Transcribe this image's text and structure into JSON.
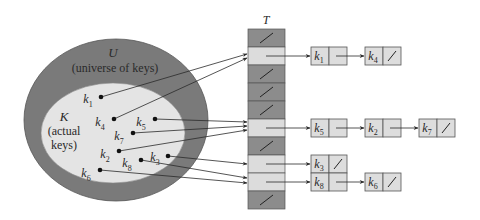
{
  "diagram": {
    "type": "hash-table-chaining",
    "colors": {
      "outer_ellipse": "#7a7a7a",
      "inner_ellipse": "#e4e4e4",
      "slot_empty": "#8c8c8c",
      "slot_used": "#dcdcdc",
      "node_fill": "#dddddd",
      "stroke": "#444444",
      "line": "#2a2a2a"
    },
    "universe": {
      "symbol": "U",
      "caption": "(universe of keys)"
    },
    "actual": {
      "symbol": "K",
      "caption_line1": "(actual",
      "caption_line2": "keys)"
    },
    "table": {
      "label": "T",
      "slots": [
        {
          "index": 0,
          "empty": true
        },
        {
          "index": 1,
          "empty": false,
          "chain": [
            "k1",
            "k4"
          ]
        },
        {
          "index": 2,
          "empty": true
        },
        {
          "index": 3,
          "empty": true
        },
        {
          "index": 4,
          "empty": true
        },
        {
          "index": 5,
          "empty": false,
          "chain": [
            "k5",
            "k2",
            "k7"
          ]
        },
        {
          "index": 6,
          "empty": true
        },
        {
          "index": 7,
          "empty": false,
          "chain": [
            "k3"
          ]
        },
        {
          "index": 8,
          "empty": false,
          "chain": [
            "k8",
            "k6"
          ]
        },
        {
          "index": 9,
          "empty": true
        }
      ]
    },
    "keys": [
      {
        "name": "k",
        "sub": "1",
        "x": 101,
        "y": 97,
        "lx": 88,
        "ly": 103,
        "slot": 1,
        "ax": 247,
        "ay": 54
      },
      {
        "name": "k",
        "sub": "4",
        "x": 114,
        "y": 119,
        "lx": 100,
        "ly": 126,
        "slot": 1,
        "ax": 247,
        "ay": 58
      },
      {
        "name": "k",
        "sub": "5",
        "x": 155,
        "y": 119,
        "lx": 141,
        "ly": 126,
        "slot": 5,
        "ax": 247,
        "ay": 122
      },
      {
        "name": "k",
        "sub": "7",
        "x": 133,
        "y": 133,
        "lx": 119,
        "ly": 140,
        "slot": 5,
        "ax": 247,
        "ay": 126
      },
      {
        "name": "k",
        "sub": "2",
        "x": 119,
        "y": 151,
        "lx": 105,
        "ly": 158,
        "slot": 5,
        "ax": 247,
        "ay": 130
      },
      {
        "name": "k",
        "sub": "3",
        "x": 168,
        "y": 156,
        "lx": 155,
        "ly": 161,
        "slot": 7,
        "ax": 247,
        "ay": 164
      },
      {
        "name": "k",
        "sub": "8",
        "x": 141,
        "y": 160,
        "lx": 127,
        "ly": 167,
        "slot": 8,
        "ax": 247,
        "ay": 178
      },
      {
        "name": "k",
        "sub": "6",
        "x": 100,
        "y": 170,
        "lx": 86,
        "ly": 177,
        "slot": 8,
        "ax": 247,
        "ay": 183
      }
    ],
    "chains": [
      {
        "slot": 1,
        "y": 47,
        "nodes": [
          {
            "name": "k",
            "sub": "1",
            "x": 311,
            "nil": false
          },
          {
            "name": "k",
            "sub": "4",
            "x": 365,
            "nil": true
          }
        ]
      },
      {
        "slot": 5,
        "y": 119,
        "nodes": [
          {
            "name": "k",
            "sub": "5",
            "x": 311,
            "nil": false
          },
          {
            "name": "k",
            "sub": "2",
            "x": 365,
            "nil": false
          },
          {
            "name": "k",
            "sub": "7",
            "x": 419,
            "nil": true
          }
        ]
      },
      {
        "slot": 7,
        "y": 155,
        "nodes": [
          {
            "name": "k",
            "sub": "3",
            "x": 311,
            "nil": true
          }
        ]
      },
      {
        "slot": 8,
        "y": 173,
        "nodes": [
          {
            "name": "k",
            "sub": "8",
            "x": 311,
            "nil": false
          },
          {
            "name": "k",
            "sub": "6",
            "x": 365,
            "nil": true
          }
        ]
      }
    ]
  }
}
